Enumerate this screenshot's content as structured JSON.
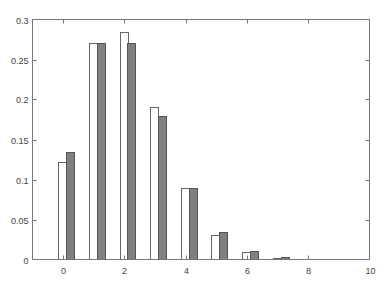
{
  "chart_data": {
    "type": "bar",
    "title": "",
    "xlabel": "",
    "ylabel": "",
    "xlim": [
      -1,
      10
    ],
    "ylim": [
      0,
      0.3
    ],
    "grid": false,
    "legend": null,
    "x": [
      0,
      1,
      2,
      3,
      4,
      5,
      6,
      7,
      8
    ],
    "series": [
      {
        "name": "series-white",
        "color": "#ffffff",
        "edge": "#666666",
        "values": [
          0.1225,
          0.27,
          0.285,
          0.19,
          0.09,
          0.031,
          0.009,
          0.002,
          0.0005
        ]
      },
      {
        "name": "series-gray",
        "color": "#808080",
        "edge": "#555555",
        "values": [
          0.135,
          0.27,
          0.27,
          0.18,
          0.09,
          0.035,
          0.011,
          0.003,
          0.001
        ]
      }
    ],
    "xticks": [
      "0",
      "2",
      "4",
      "6",
      "8",
      "10"
    ],
    "xtick_values": [
      0,
      2,
      4,
      6,
      8,
      10
    ],
    "yticks": [
      "0",
      "0.05",
      "0.1",
      "0.15",
      "0.2",
      "0.25",
      "0.3"
    ],
    "ytick_values": [
      0,
      0.05,
      0.1,
      0.15,
      0.2,
      0.25,
      0.3
    ]
  },
  "colors": {
    "axis": "#777777",
    "bar_white_fill": "#ffffff",
    "bar_gray_fill": "#808080"
  }
}
